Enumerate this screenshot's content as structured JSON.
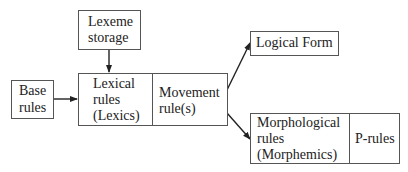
{
  "diagram": {
    "nodes": {
      "lexeme_storage": {
        "line1": "Lexeme",
        "line2": "storage"
      },
      "base_rules": {
        "line1": "Base",
        "line2": "rules"
      },
      "lexical_rules": {
        "line1": "Lexical",
        "line2": "rules",
        "line3": "(Lexics)"
      },
      "movement_rules": {
        "line1": "Movement",
        "line2": "rule(s)"
      },
      "logical_form": {
        "line1": "Logical Form"
      },
      "morphological_rules": {
        "line1": "Morphological",
        "line2": "rules",
        "line3": "(Morphemics)"
      },
      "p_rules": {
        "line1": "P-rules"
      }
    },
    "edges": [
      {
        "from": "lexeme_storage",
        "to": "lexical_rules"
      },
      {
        "from": "base_rules",
        "to": "lexical_rules"
      },
      {
        "from": "movement_rules",
        "to": "logical_form"
      },
      {
        "from": "movement_rules",
        "to": "morphological_rules"
      }
    ],
    "colors": {
      "line": "#555555",
      "text": "#222222",
      "background": "#ffffff"
    }
  }
}
